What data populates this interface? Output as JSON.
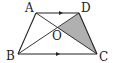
{
  "diagram": {
    "type": "geometry",
    "shape": "trapezoid",
    "points": {
      "A": {
        "label": "A",
        "x": 36,
        "y": 13
      },
      "D": {
        "label": "D",
        "x": 79,
        "y": 13
      },
      "B": {
        "label": "B",
        "x": 18,
        "y": 54
      },
      "C": {
        "label": "C",
        "x": 97,
        "y": 54
      },
      "O": {
        "label": "O",
        "x": 57.5,
        "y": 28
      }
    },
    "segments": [
      "AD",
      "BC",
      "AB",
      "DC",
      "AC",
      "BD"
    ],
    "parallel": [
      "AD",
      "BC"
    ],
    "shaded_region": {
      "vertices": [
        "O",
        "D",
        "C"
      ],
      "color": "#b0b0b0"
    },
    "line_color": "#222222"
  }
}
